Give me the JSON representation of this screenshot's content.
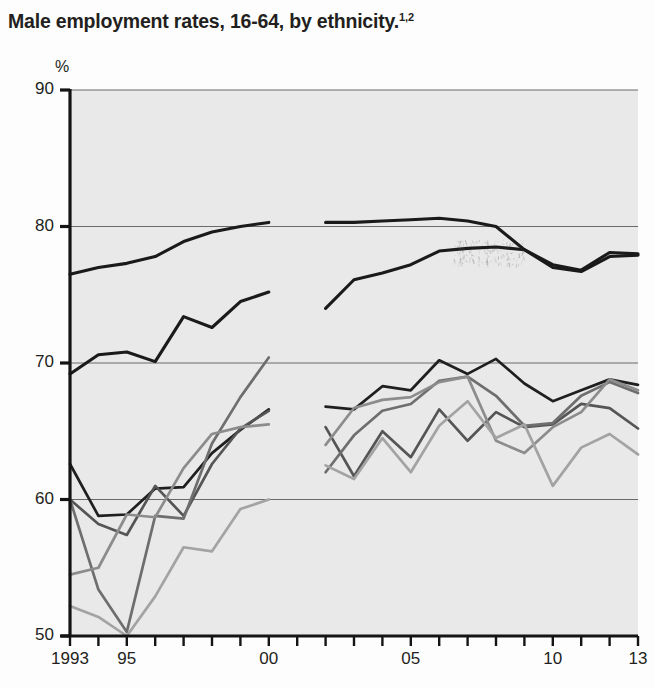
{
  "chart_data": {
    "type": "line",
    "title": "Male employment rates, 16-64, by ethnicity.",
    "title_superscript": "1,2",
    "ylabel": "%",
    "xlabel": "",
    "ylim": [
      50,
      90
    ],
    "y_ticks": [
      50,
      60,
      70,
      80,
      90
    ],
    "y_tick_labels": [
      "50",
      "60",
      "70",
      "80",
      "90"
    ],
    "xlim": [
      1993,
      2013
    ],
    "x_ticks": [
      1993,
      1994,
      1995,
      1996,
      1997,
      1998,
      1999,
      2000,
      2001,
      2002,
      2003,
      2004,
      2005,
      2006,
      2007,
      2008,
      2009,
      2010,
      2011,
      2012,
      2013
    ],
    "x_tick_labels": [
      {
        "x": 1993,
        "label": "1993"
      },
      {
        "x": 1995,
        "label": "95"
      },
      {
        "x": 2000,
        "label": "00"
      },
      {
        "x": 2005,
        "label": "05"
      },
      {
        "x": 2010,
        "label": "10"
      },
      {
        "x": 2013,
        "label": "13"
      }
    ],
    "grid": "horizontal",
    "grid_values": [
      60,
      70,
      80,
      90
    ],
    "plot_background": "#e9e9e9",
    "legend_position": "none",
    "data_break": {
      "after": 2000,
      "resumes": 2002,
      "note": "series are broken between 2000 and 2002"
    },
    "artifact": {
      "type": "scan-smudge",
      "x_range": [
        2006.5,
        2009.0
      ],
      "y_range": [
        77.2,
        79.0
      ]
    },
    "series": [
      {
        "name": "series-1-top-dark",
        "color": "#1a1a1a",
        "width": 3.1,
        "segments": [
          {
            "x": [
              1993,
              1994,
              1995,
              1996,
              1997,
              1998,
              1999,
              2000
            ],
            "y": [
              76.5,
              77.0,
              77.3,
              77.8,
              78.9,
              79.6,
              80.0,
              80.3
            ]
          },
          {
            "x": [
              2002,
              2003,
              2004,
              2005,
              2006,
              2007,
              2008,
              2009,
              2010,
              2011,
              2012,
              2013
            ],
            "y": [
              80.3,
              80.3,
              80.4,
              80.5,
              80.6,
              80.4,
              80.0,
              78.3,
              77.0,
              76.7,
              77.8,
              77.9
            ]
          }
        ]
      },
      {
        "name": "series-2-second-dark",
        "color": "#1a1a1a",
        "width": 3.1,
        "segments": [
          {
            "x": [
              1993,
              1994,
              1995,
              1996,
              1997,
              1998,
              1999,
              2000
            ],
            "y": [
              69.2,
              70.6,
              70.8,
              70.1,
              73.4,
              72.6,
              74.5,
              75.2
            ]
          },
          {
            "x": [
              2002,
              2003,
              2004,
              2005,
              2006,
              2007,
              2008,
              2009,
              2010,
              2011,
              2012,
              2013
            ],
            "y": [
              74.0,
              76.1,
              76.6,
              77.2,
              78.2,
              78.4,
              78.5,
              78.3,
              77.2,
              76.8,
              78.1,
              78.0
            ]
          }
        ]
      },
      {
        "name": "series-3-dark-lower",
        "color": "#1f1f1f",
        "width": 2.7,
        "segments": [
          {
            "x": [
              1993,
              1994,
              1995,
              1996,
              1997,
              1998,
              1999,
              2000
            ],
            "y": [
              62.6,
              58.8,
              58.9,
              60.8,
              60.9,
              63.4,
              65.1,
              66.6
            ]
          },
          {
            "x": [
              2002,
              2003,
              2004,
              2005,
              2006,
              2007,
              2008,
              2009,
              2010,
              2011,
              2012,
              2013
            ],
            "y": [
              66.8,
              66.6,
              68.3,
              68.0,
              70.2,
              69.2,
              70.3,
              68.5,
              67.2,
              68.0,
              68.8,
              68.4
            ]
          }
        ]
      },
      {
        "name": "series-4-mid-grey",
        "color": "#555555",
        "width": 2.7,
        "segments": [
          {
            "x": [
              1993,
              1994,
              1995,
              1996,
              1997,
              1998,
              1999,
              2000
            ],
            "y": [
              60.0,
              58.2,
              57.4,
              61.0,
              58.8,
              62.6,
              65.2,
              66.5
            ]
          },
          {
            "x": [
              2002,
              2003,
              2004,
              2005,
              2006,
              2007,
              2008,
              2009,
              2010,
              2011,
              2012,
              2013
            ],
            "y": [
              65.3,
              61.7,
              65.0,
              63.1,
              66.6,
              64.3,
              66.4,
              65.3,
              65.5,
              67.0,
              66.7,
              65.2
            ]
          }
        ]
      },
      {
        "name": "series-5-grey",
        "color": "#6e6e6e",
        "width": 2.7,
        "segments": [
          {
            "x": [
              1993,
              1994,
              1995,
              1996,
              1997,
              1998,
              1999,
              2000
            ],
            "y": [
              60.0,
              53.4,
              50.3,
              58.8,
              58.6,
              64.1,
              67.5,
              70.4
            ]
          },
          {
            "x": [
              2002,
              2003,
              2004,
              2005,
              2006,
              2007,
              2008,
              2009,
              2010,
              2011,
              2012,
              2013
            ],
            "y": [
              62.0,
              64.7,
              66.5,
              67.0,
              68.7,
              69.0,
              67.6,
              65.4,
              65.6,
              67.6,
              68.6,
              67.8
            ]
          }
        ]
      },
      {
        "name": "series-6-light-grey",
        "color": "#8c8c8c",
        "width": 2.7,
        "segments": [
          {
            "x": [
              1993,
              1994,
              1995,
              1996,
              1997,
              1998,
              1999,
              2000
            ],
            "y": [
              54.5,
              55.0,
              58.9,
              58.7,
              62.3,
              64.8,
              65.3,
              65.5
            ]
          },
          {
            "x": [
              2002,
              2003,
              2004,
              2005,
              2006,
              2007,
              2008,
              2009,
              2010,
              2011,
              2012,
              2013
            ],
            "y": [
              64.0,
              66.7,
              67.3,
              67.5,
              68.6,
              69.0,
              64.3,
              63.4,
              65.3,
              66.4,
              68.8,
              68.0
            ]
          }
        ]
      },
      {
        "name": "series-7-lightest-grey",
        "color": "#a3a3a3",
        "width": 2.7,
        "segments": [
          {
            "x": [
              1993,
              1994,
              1995,
              1996,
              1997,
              1998,
              1999,
              2000
            ],
            "y": [
              52.2,
              51.4,
              50.0,
              52.9,
              56.5,
              56.2,
              59.3,
              60.0
            ]
          },
          {
            "x": [
              2002,
              2003,
              2004,
              2005,
              2006,
              2007,
              2008,
              2009,
              2010,
              2011,
              2012,
              2013
            ],
            "y": [
              62.5,
              61.5,
              64.5,
              62.0,
              65.4,
              67.2,
              64.5,
              65.5,
              61.0,
              63.8,
              64.8,
              63.3
            ]
          }
        ]
      }
    ]
  }
}
